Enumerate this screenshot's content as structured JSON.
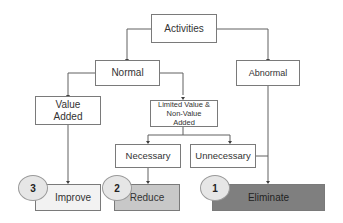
{
  "nodes": {
    "activities": "Activities",
    "normal": "Normal",
    "abnormal": "Abnormal",
    "value_added": "Value Added",
    "limited_value": "Limited Value & Non-Value Added",
    "necessary": "Necessary",
    "unnecessary": "Unnecessary",
    "improve": "Improve",
    "reduce": "Reduce",
    "eliminate": "Eliminate"
  },
  "badges": {
    "improve": "3",
    "reduce": "2",
    "eliminate": "1"
  },
  "colors": {
    "improve_fill": "#f2f2f2",
    "reduce_fill": "#c8c8c8",
    "eliminate_fill": "#7f7f7f",
    "line": "#606060"
  }
}
